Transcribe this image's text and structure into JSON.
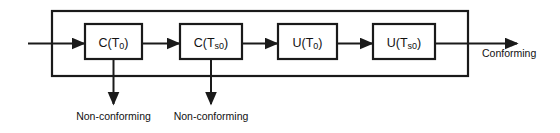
{
  "diagram": {
    "type": "process-flow-block-diagram",
    "colors": {
      "stroke": "#1a1a1a",
      "background": "#ffffff",
      "text": "#111111"
    },
    "input_arrow": {
      "name": "input-arrow",
      "label": ""
    },
    "blocks": [
      {
        "id": "block-c-t0",
        "base": "C(T",
        "sub": "0",
        "close": ")",
        "full": "C(T0)"
      },
      {
        "id": "block-c-ts0",
        "base": "C(T",
        "sub": "s0",
        "close": ")",
        "full": "C(Ts0)"
      },
      {
        "id": "block-u-t0",
        "base": "U(T",
        "sub": "0",
        "close": ")",
        "full": "U(T0)"
      },
      {
        "id": "block-u-ts0",
        "base": "U(T",
        "sub": "s0",
        "close": ")",
        "full": "U(Ts0)"
      }
    ],
    "reject_outputs": [
      {
        "id": "reject-1",
        "label": "Non-conforming"
      },
      {
        "id": "reject-2",
        "label": "Non-conforming"
      }
    ],
    "accept_output": {
      "id": "accept-1",
      "label": "Conforming"
    }
  }
}
